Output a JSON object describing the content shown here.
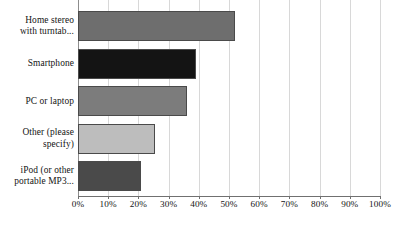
{
  "chart_data": {
    "type": "bar",
    "orientation": "horizontal",
    "title": "",
    "xlabel": "",
    "ylabel": "",
    "categories": [
      "Home stereo\nwith turntab...",
      "Smartphone",
      "PC or laptop",
      "Other (please\nspecify)",
      "iPod (or other\nportable  MP3..."
    ],
    "values": [
      52,
      39,
      36,
      25.5,
      21
    ],
    "value_unit": "%",
    "xlim": [
      0,
      100
    ],
    "xticks": [
      0,
      10,
      20,
      30,
      40,
      50,
      60,
      70,
      80,
      90,
      100
    ],
    "xtick_labels": [
      "0%",
      "10%",
      "20%",
      "30%",
      "40%",
      "50%",
      "60%",
      "70%",
      "80%",
      "90%",
      "100%"
    ],
    "grid": true,
    "grid_axis": "x",
    "legend": false,
    "bar_colors": [
      "#6e6e6e",
      "#141414",
      "#7c7c7c",
      "#bdbdbd",
      "#4a4a4a"
    ],
    "bar_edge_color": "#4a4a4a",
    "grid_color": "#d8d8d8",
    "axis_color": "#707070",
    "background_color": "#ffffff"
  }
}
